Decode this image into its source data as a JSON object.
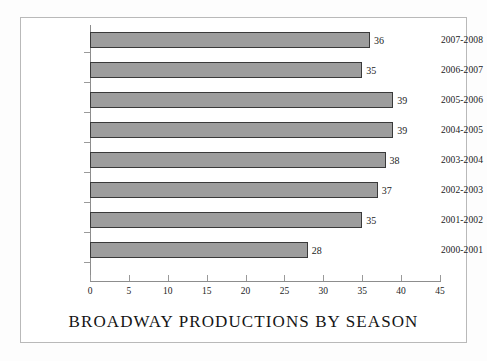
{
  "chart_data": {
    "type": "bar",
    "orientation": "horizontal",
    "title": "BROADWAY PRODUCTIONS BY SEASON",
    "xlabel": "",
    "ylabel": "",
    "categories": [
      "2007-2008",
      "2006-2007",
      "2005-2006",
      "2004-2005",
      "2003-2004",
      "2002-2003",
      "2001-2002",
      "2000-2001"
    ],
    "values": [
      36,
      35,
      39,
      39,
      38,
      37,
      35,
      28
    ],
    "value_labels": [
      "36",
      "35",
      "39",
      "39",
      "38",
      "37",
      "35",
      "28"
    ],
    "xlim": [
      0,
      45
    ],
    "xticks": [
      0,
      5,
      10,
      15,
      20,
      25,
      30,
      35,
      40,
      45
    ],
    "xtick_labels": [
      "0",
      "5",
      "10",
      "15",
      "20",
      "25",
      "30",
      "35",
      "40",
      "45"
    ],
    "grid": false,
    "legend": false,
    "bar_color": "#9d9d9d",
    "bar_border_color": "#3a3a3a",
    "axis_color": "#8d8d8d",
    "text_color": "#1b1b1b",
    "background_color": "#ffffff"
  }
}
